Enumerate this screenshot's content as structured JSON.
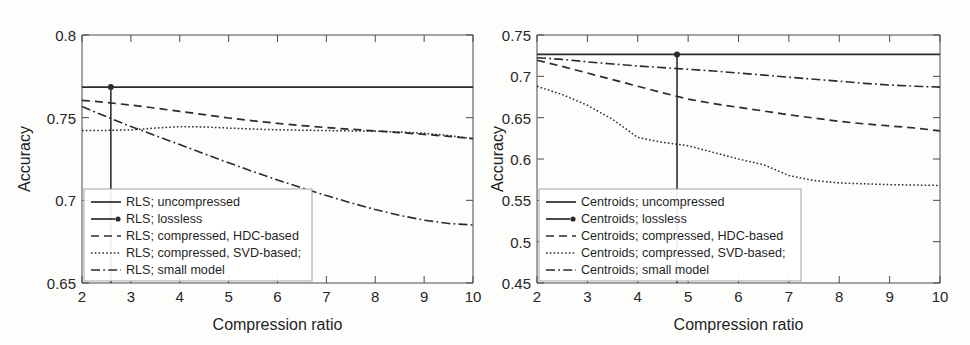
{
  "figure": {
    "background_color": "#fdfdfc",
    "line_color": "#2b2b2b"
  },
  "chart_data": [
    {
      "type": "line",
      "panel": "left",
      "title": "",
      "xlabel": "Compression ratio",
      "ylabel": "Accuracy",
      "xlim": [
        2,
        10
      ],
      "ylim": [
        0.65,
        0.8
      ],
      "xticks": [
        "2",
        "3",
        "4",
        "5",
        "6",
        "7",
        "8",
        "9",
        "10"
      ],
      "yticks": [
        "0.65",
        "0.7",
        "0.75",
        "0.8"
      ],
      "grid": false,
      "legend_position": "lower-left",
      "x": [
        2,
        2.5,
        3,
        3.5,
        4,
        4.5,
        5,
        5.5,
        6,
        6.5,
        7,
        7.5,
        8,
        8.5,
        9,
        9.5,
        10
      ],
      "series": [
        {
          "name": "RLS; uncompressed",
          "style": "solid",
          "values": [
            0.7685,
            0.7685,
            0.7685,
            0.7685,
            0.7685,
            0.7685,
            0.7685,
            0.7685,
            0.7685,
            0.7685,
            0.7685,
            0.7685,
            0.7685,
            0.7685,
            0.7685,
            0.7685,
            0.7685
          ]
        },
        {
          "name": "RLS; lossless",
          "style": "marker-vline",
          "marker_x": 2.59,
          "marker_y": 0.7685
        },
        {
          "name": "RLS; compressed, HDC-based",
          "style": "dashed",
          "values": [
            0.7605,
            0.7592,
            0.7576,
            0.7558,
            0.7538,
            0.7518,
            0.7498,
            0.7481,
            0.7465,
            0.7452,
            0.744,
            0.743,
            0.742,
            0.741,
            0.7399,
            0.7387,
            0.7373
          ]
        },
        {
          "name": "RLS; compressed, SVD-based;",
          "style": "dotted",
          "values": [
            0.7423,
            0.7423,
            0.7426,
            0.7437,
            0.7446,
            0.7444,
            0.7437,
            0.7431,
            0.7427,
            0.7424,
            0.7422,
            0.742,
            0.7418,
            0.7413,
            0.7406,
            0.7392,
            0.7373
          ]
        },
        {
          "name": "RLS; small model",
          "style": "dashdot",
          "values": [
            0.7567,
            0.7506,
            0.7446,
            0.7392,
            0.7337,
            0.7282,
            0.7227,
            0.7174,
            0.7123,
            0.7075,
            0.7029,
            0.6985,
            0.6944,
            0.6909,
            0.688,
            0.686,
            0.6851
          ]
        }
      ]
    },
    {
      "type": "line",
      "panel": "right",
      "title": "",
      "xlabel": "Compression ratio",
      "ylabel": "Accuracy",
      "xlim": [
        2,
        10
      ],
      "ylim": [
        0.45,
        0.75
      ],
      "xticks": [
        "2",
        "3",
        "4",
        "5",
        "6",
        "7",
        "8",
        "9",
        "10"
      ],
      "yticks": [
        "0.45",
        "0.5",
        "0.55",
        "0.6",
        "0.65",
        "0.7",
        "0.75"
      ],
      "grid": false,
      "legend_position": "lower-left",
      "x": [
        2,
        2.5,
        3,
        3.5,
        4,
        4.5,
        5,
        5.5,
        6,
        6.5,
        7,
        7.5,
        8,
        8.5,
        9,
        9.5,
        10
      ],
      "series": [
        {
          "name": "Centroids; uncompressed",
          "style": "solid",
          "values": [
            0.7265,
            0.7265,
            0.7265,
            0.7265,
            0.7265,
            0.7265,
            0.7265,
            0.7265,
            0.7265,
            0.7265,
            0.7265,
            0.7265,
            0.7265,
            0.7265,
            0.7265,
            0.7265,
            0.7265
          ]
        },
        {
          "name": "Centroids; lossless",
          "style": "marker-vline",
          "marker_x": 4.78,
          "marker_y": 0.7265
        },
        {
          "name": "Centroids; compressed, HDC-based",
          "style": "dashed",
          "values": [
            0.7195,
            0.712,
            0.704,
            0.696,
            0.688,
            0.68,
            0.6725,
            0.667,
            0.6625,
            0.658,
            0.6535,
            0.6495,
            0.6455,
            0.6425,
            0.64,
            0.6375,
            0.634
          ]
        },
        {
          "name": "Centroids; compressed, SVD-based;",
          "style": "dotted",
          "values": [
            0.688,
            0.678,
            0.665,
            0.648,
            0.626,
            0.62,
            0.616,
            0.608,
            0.6,
            0.593,
            0.58,
            0.574,
            0.571,
            0.57,
            0.569,
            0.5685,
            0.568
          ]
        },
        {
          "name": "Centroids; small model",
          "style": "dashdot",
          "values": [
            0.7225,
            0.7205,
            0.7175,
            0.715,
            0.7125,
            0.7105,
            0.7085,
            0.7065,
            0.704,
            0.7015,
            0.699,
            0.6965,
            0.694,
            0.6915,
            0.6895,
            0.688,
            0.687
          ]
        }
      ]
    }
  ]
}
